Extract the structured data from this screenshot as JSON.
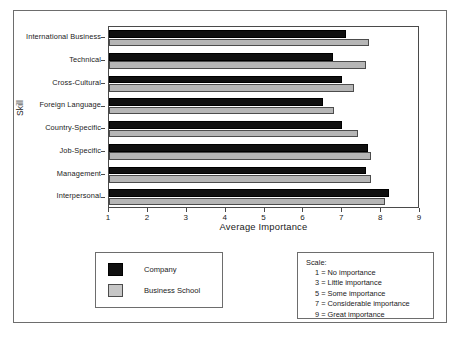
{
  "chart_data": {
    "type": "bar",
    "orientation": "horizontal",
    "title": "",
    "xlabel": "Average Importance",
    "ylabel": "Skill",
    "xlim": [
      1,
      9
    ],
    "xticks": [
      1,
      2,
      3,
      4,
      5,
      6,
      7,
      8,
      9
    ],
    "grid": false,
    "legend_position": "below-left",
    "categories": [
      "International Business",
      "Technical",
      "Cross-Cultural",
      "Foreign Language",
      "Country-Specific",
      "Job-Specific",
      "Management",
      "Interpersonal"
    ],
    "series": [
      {
        "name": "Company",
        "color": "#101010",
        "values": [
          7.1,
          6.75,
          7.0,
          6.5,
          7.0,
          7.65,
          7.6,
          8.2
        ]
      },
      {
        "name": "Business School",
        "color": "#b6b6b6",
        "values": [
          7.7,
          7.6,
          7.3,
          6.8,
          7.4,
          7.75,
          7.75,
          8.1
        ]
      }
    ]
  },
  "axes": {
    "y_title": "Skill",
    "x_title": "Average Importance",
    "x_tick_labels": [
      "1",
      "2",
      "3",
      "4",
      "5",
      "6",
      "7",
      "8",
      "9"
    ]
  },
  "legend": {
    "items": [
      {
        "label": "Company",
        "swatch": "company"
      },
      {
        "label": "Business School",
        "swatch": "school"
      }
    ]
  },
  "scale": {
    "title": "Scale:",
    "lines": [
      "1 = No importance",
      "3 = Little importance",
      "5 = Some importance",
      "7 = Considerable importance",
      "9 = Great importance"
    ]
  }
}
